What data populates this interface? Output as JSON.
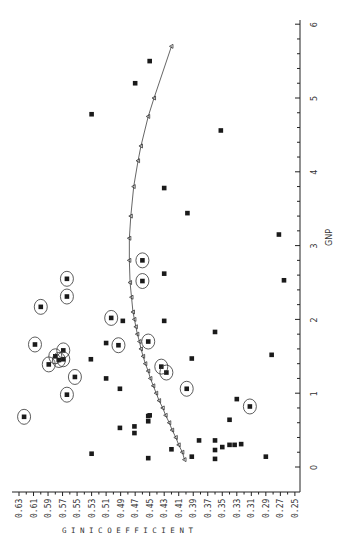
{
  "chart_data": {
    "type": "scatter",
    "orientation_note": "figure is printed rotated 90 degrees: Gini coefficient axis runs along the bottom (0.63 at left to 0.25 at right), GNP axis runs vertically along the right (0 at bottom to 6 at top)",
    "title": "",
    "xlabel": "GNP",
    "ylabel": "GINI COEFFICIENT",
    "xlim": [
      0,
      6
    ],
    "ylim": [
      0.25,
      0.63
    ],
    "x_ticks": [
      "0",
      "1",
      "2",
      "3",
      "4",
      "5",
      "6"
    ],
    "y_ticks": [
      "0.63",
      "0.61",
      "0.59",
      "0.57",
      "0.55",
      "0.53",
      "0.51",
      "0.49",
      "0.47",
      "0.45",
      "0.43",
      "0.41",
      "0.39",
      "0.37",
      "0.35",
      "0.33",
      "0.31",
      "0.29",
      "0.27",
      "0.25"
    ],
    "grid": false,
    "legend": null,
    "series": [
      {
        "name": "Actual data (circled)",
        "marker": "circled-square",
        "points": [
          {
            "gnp": 0.68,
            "gini": 0.623
          },
          {
            "gnp": 0.98,
            "gini": 0.564
          },
          {
            "gnp": 1.22,
            "gini": 0.553
          },
          {
            "gnp": 1.39,
            "gini": 0.589
          },
          {
            "gnp": 1.45,
            "gini": 0.575
          },
          {
            "gnp": 1.5,
            "gini": 0.58
          },
          {
            "gnp": 1.46,
            "gini": 0.569
          },
          {
            "gnp": 1.58,
            "gini": 0.569
          },
          {
            "gnp": 1.66,
            "gini": 0.608
          },
          {
            "gnp": 2.17,
            "gini": 0.6
          },
          {
            "gnp": 2.31,
            "gini": 0.564
          },
          {
            "gnp": 2.55,
            "gini": 0.564
          },
          {
            "gnp": 2.02,
            "gini": 0.503
          },
          {
            "gnp": 1.65,
            "gini": 0.493
          },
          {
            "gnp": 1.7,
            "gini": 0.452
          },
          {
            "gnp": 2.52,
            "gini": 0.46
          },
          {
            "gnp": 2.8,
            "gini": 0.46
          },
          {
            "gnp": 1.36,
            "gini": 0.434
          },
          {
            "gnp": 1.28,
            "gini": 0.427
          },
          {
            "gnp": 1.06,
            "gini": 0.399
          },
          {
            "gnp": 0.82,
            "gini": 0.312
          }
        ]
      },
      {
        "name": "Actual data",
        "marker": "square",
        "points": [
          {
            "gnp": 0.18,
            "gini": 0.53
          },
          {
            "gnp": 0.53,
            "gini": 0.491
          },
          {
            "gnp": 0.46,
            "gini": 0.471
          },
          {
            "gnp": 0.55,
            "gini": 0.471
          },
          {
            "gnp": 0.62,
            "gini": 0.452
          },
          {
            "gnp": 0.69,
            "gini": 0.452
          },
          {
            "gnp": 0.7,
            "gini": 0.45
          },
          {
            "gnp": 0.12,
            "gini": 0.452
          },
          {
            "gnp": 1.06,
            "gini": 0.491
          },
          {
            "gnp": 1.2,
            "gini": 0.51
          },
          {
            "gnp": 1.46,
            "gini": 0.531
          },
          {
            "gnp": 1.68,
            "gini": 0.51
          },
          {
            "gnp": 1.98,
            "gini": 0.487
          },
          {
            "gnp": 1.98,
            "gini": 0.43
          },
          {
            "gnp": 2.62,
            "gini": 0.43
          },
          {
            "gnp": 3.78,
            "gini": 0.43
          },
          {
            "gnp": 3.44,
            "gini": 0.398
          },
          {
            "gnp": 4.78,
            "gini": 0.53
          },
          {
            "gnp": 5.2,
            "gini": 0.47
          },
          {
            "gnp": 5.5,
            "gini": 0.45
          },
          {
            "gnp": 6.28,
            "gini": 0.43
          },
          {
            "gnp": 4.56,
            "gini": 0.352
          },
          {
            "gnp": 1.47,
            "gini": 0.392
          },
          {
            "gnp": 1.83,
            "gini": 0.36
          },
          {
            "gnp": 0.24,
            "gini": 0.42
          },
          {
            "gnp": 0.14,
            "gini": 0.392
          },
          {
            "gnp": 0.36,
            "gini": 0.382
          },
          {
            "gnp": 0.36,
            "gini": 0.36
          },
          {
            "gnp": 0.23,
            "gini": 0.36
          },
          {
            "gnp": 0.11,
            "gini": 0.36
          },
          {
            "gnp": 0.27,
            "gini": 0.35
          },
          {
            "gnp": 0.3,
            "gini": 0.34
          },
          {
            "gnp": 0.3,
            "gini": 0.333
          },
          {
            "gnp": 0.31,
            "gini": 0.324
          },
          {
            "gnp": 0.64,
            "gini": 0.34
          },
          {
            "gnp": 0.92,
            "gini": 0.33
          },
          {
            "gnp": 0.14,
            "gini": 0.29
          },
          {
            "gnp": 1.52,
            "gini": 0.282
          },
          {
            "gnp": 3.15,
            "gini": 0.272
          },
          {
            "gnp": 2.53,
            "gini": 0.265
          }
        ]
      },
      {
        "name": "Fitted curve",
        "marker": "triangle-line",
        "points": [
          {
            "gnp": 0.1,
            "gini": 0.402
          },
          {
            "gnp": 0.2,
            "gini": 0.405
          },
          {
            "gnp": 0.3,
            "gini": 0.41
          },
          {
            "gnp": 0.4,
            "gini": 0.414
          },
          {
            "gnp": 0.5,
            "gini": 0.419
          },
          {
            "gnp": 0.6,
            "gini": 0.423
          },
          {
            "gnp": 0.7,
            "gini": 0.428
          },
          {
            "gnp": 0.8,
            "gini": 0.432
          },
          {
            "gnp": 0.9,
            "gini": 0.437
          },
          {
            "gnp": 1.0,
            "gini": 0.441
          },
          {
            "gnp": 1.1,
            "gini": 0.445
          },
          {
            "gnp": 1.2,
            "gini": 0.449
          },
          {
            "gnp": 1.3,
            "gini": 0.452
          },
          {
            "gnp": 1.4,
            "gini": 0.456
          },
          {
            "gnp": 1.5,
            "gini": 0.459
          },
          {
            "gnp": 1.6,
            "gini": 0.462
          },
          {
            "gnp": 1.7,
            "gini": 0.464
          },
          {
            "gnp": 1.8,
            "gini": 0.467
          },
          {
            "gnp": 1.9,
            "gini": 0.469
          },
          {
            "gnp": 2.0,
            "gini": 0.471
          },
          {
            "gnp": 2.1,
            "gini": 0.473
          },
          {
            "gnp": 2.3,
            "gini": 0.475
          },
          {
            "gnp": 2.5,
            "gini": 0.477
          },
          {
            "gnp": 2.8,
            "gini": 0.478
          },
          {
            "gnp": 3.1,
            "gini": 0.478
          },
          {
            "gnp": 3.4,
            "gini": 0.476
          },
          {
            "gnp": 3.8,
            "gini": 0.472
          },
          {
            "gnp": 4.15,
            "gini": 0.466
          },
          {
            "gnp": 4.35,
            "gini": 0.462
          },
          {
            "gnp": 4.75,
            "gini": 0.452
          },
          {
            "gnp": 5.0,
            "gini": 0.444
          },
          {
            "gnp": 5.7,
            "gini": 0.42
          }
        ]
      }
    ]
  },
  "labels": {
    "x_axis_title": "GNP",
    "y_axis_title": "G I N I   C O E F F I C I E N T"
  }
}
